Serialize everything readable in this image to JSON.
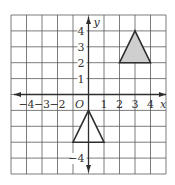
{
  "diagram": {
    "type": "coordinate-grid",
    "grid": {
      "x_min": -5,
      "x_max": 5,
      "y_min": -5,
      "y_max": 5,
      "step": 1
    },
    "axes": {
      "x_label": "x",
      "y_label": "y",
      "origin_label": "O",
      "x_ticks": [
        {
          "value": -4,
          "label": "−4"
        },
        {
          "value": -3,
          "label": "−3"
        },
        {
          "value": -2,
          "label": "−2"
        },
        {
          "value": 1,
          "label": "1"
        },
        {
          "value": 2,
          "label": "2"
        },
        {
          "value": 3,
          "label": "3"
        },
        {
          "value": 4,
          "label": "4"
        }
      ],
      "y_ticks": [
        {
          "value": 4,
          "label": "4"
        },
        {
          "value": 3,
          "label": "3"
        },
        {
          "value": 2,
          "label": "2"
        },
        {
          "value": 1,
          "label": "1"
        },
        {
          "value": -4,
          "label": "−4"
        }
      ]
    },
    "shapes": [
      {
        "name": "shaded-triangle",
        "vertices": [
          [
            3,
            4
          ],
          [
            2,
            2
          ],
          [
            4,
            2
          ]
        ],
        "fill": "#cfcfcf",
        "stroke": "#2e2e2e"
      },
      {
        "name": "unshaded-triangle",
        "vertices": [
          [
            0,
            -1
          ],
          [
            -1,
            -3
          ],
          [
            1,
            -3
          ]
        ],
        "fill": "#ffffff",
        "stroke": "#2e2e2e"
      }
    ],
    "colors": {
      "grid": "#5a5a5a",
      "axis": "#2e2e2e",
      "text": "#333333"
    }
  }
}
